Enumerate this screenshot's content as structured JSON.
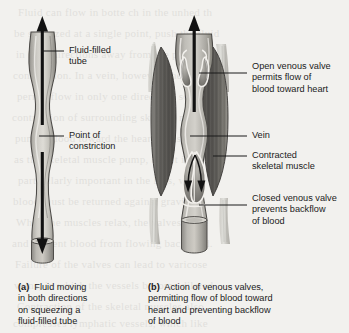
{
  "figure": {
    "kind": "biology-diagram",
    "background_color": "#f2f1ee",
    "ink_color": "#1b1b1b",
    "panels": [
      {
        "id": "a",
        "tag": "(a)",
        "caption": "Fluid moving\nin both directions\non squeezing a\nfluid-filled tube",
        "labels": [
          {
            "name": "fluid-filled-tube",
            "text": "Fluid-filled\ntube"
          },
          {
            "name": "point-of-constriction",
            "text": "Point of\nconstriction"
          }
        ],
        "arrows": [
          {
            "name": "upward-flow-arrow",
            "direction": "up"
          },
          {
            "name": "downward-flow-arrow",
            "direction": "down"
          }
        ]
      },
      {
        "id": "b",
        "tag": "(b)",
        "caption": "Action of venous valves,\npermitting flow of blood toward\nheart and preventing backflow\nof blood",
        "labels": [
          {
            "name": "open-venous-valve",
            "text": "Open venous valve\npermits flow of\nblood toward heart"
          },
          {
            "name": "vein",
            "text": "Vein"
          },
          {
            "name": "contracted-skeletal-muscle",
            "text": "Contracted\nskeletal muscle"
          },
          {
            "name": "closed-venous-valve",
            "text": "Closed venous valve\nprevents backflow\nof blood"
          }
        ],
        "arrows": [
          {
            "name": "blood-flow-toward-heart-arrow",
            "direction": "up"
          },
          {
            "name": "backflow-left-arrow",
            "direction": "down"
          },
          {
            "name": "backflow-right-arrow",
            "direction": "down"
          }
        ]
      }
    ],
    "ghost_text": [
      "Fluid can flow in botte ch     in the unhed th",
      "be squeezed at a single point, push the fluid",
      "in both directions away from the point of",
      "constriction. In a vein, however, the valves",
      "permit flow in only one direction, so the",
      "contraction of surrounding skeletal muscles",
      "pumps blood toward the heart. This is known",
      "as the skeletal muscle pump, and it is",
      "particularly important in the legs, where",
      "blood must be returned against gravity.",
      "When the muscles relax, the valves close",
      "and prevent blood from flowing backward.",
      "Failure of the valves can lead to varicose",
      "veins, in which the vessels become dilated.",
      "Contraction of the skeletal muscles also",
      "compresses lymphatic vessels, which like"
    ]
  }
}
